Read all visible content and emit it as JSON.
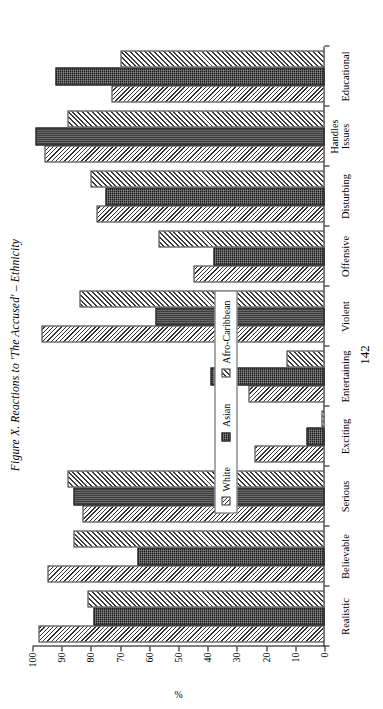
{
  "figure": {
    "title": "Figure X. Reactions to 'The Accused' – Ethnicity",
    "folio": "142"
  },
  "legend": {
    "items": [
      {
        "label": "White",
        "swatch": "hatch-light-diagonal",
        "color": "#ffffff"
      },
      {
        "label": "Asian",
        "swatch": "solid-dark-dotted",
        "color": "#1c1c1c"
      },
      {
        "label": "Afro-Caribbean",
        "swatch": "hatch-dark-diagonal",
        "color": "#3a3a3a"
      }
    ]
  },
  "chart_data": {
    "type": "bar",
    "orientation": "horizontal-rotated",
    "title": "Figure X. Reactions to 'The Accused' – Ethnicity",
    "xlabel": "",
    "ylabel": "%",
    "ylim": [
      0,
      100
    ],
    "yticks": [
      0,
      10,
      20,
      30,
      40,
      50,
      60,
      70,
      80,
      90,
      100
    ],
    "grid": false,
    "legend_position": "inside-center",
    "categories": [
      "Realistic",
      "Believable",
      "Serious",
      "Exciting",
      "Entertaining",
      "Violent",
      "Offensive",
      "Disturbing",
      "Handles Issues",
      "Educational"
    ],
    "series": [
      {
        "name": "White",
        "values": [
          98,
          95,
          83,
          24,
          26,
          97,
          45,
          78,
          96,
          73
        ]
      },
      {
        "name": "Asian",
        "values": [
          79,
          64,
          86,
          6,
          39,
          58,
          38,
          75,
          99,
          92
        ]
      },
      {
        "name": "Afro-Caribbean",
        "values": [
          81,
          86,
          88,
          1,
          13,
          84,
          57,
          80,
          88,
          70
        ]
      }
    ]
  }
}
